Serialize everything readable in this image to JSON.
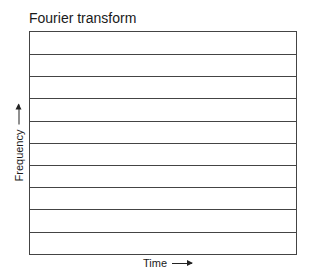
{
  "title": "Fourier transform",
  "x_axis": {
    "label": "Time",
    "arrow": "right-arrow-icon"
  },
  "y_axis": {
    "label": "Frequency",
    "arrow": "up-arrow-icon"
  },
  "grid": {
    "orientation": "horizontal",
    "bands": 10,
    "line_color": "#444444"
  }
}
